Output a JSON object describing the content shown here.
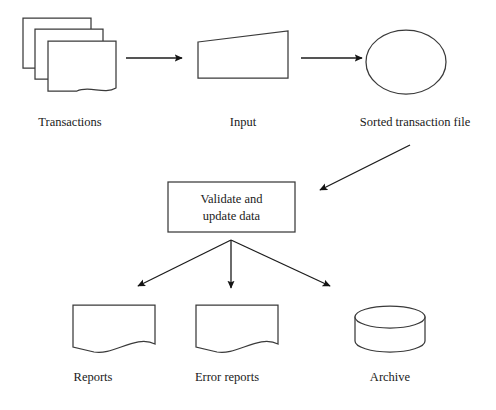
{
  "diagram": {
    "background_color": "#ffffff",
    "stroke_color": "#3a3a3a",
    "arrow_color": "#141414",
    "text_color": "#1a1a1a",
    "nodes": [
      {
        "id": "transactions",
        "label": "Transactions",
        "shape": "document-stack",
        "role": "input-documents"
      },
      {
        "id": "input",
        "label": "Input",
        "shape": "punched-card",
        "role": "input-media"
      },
      {
        "id": "sorted-transaction-file",
        "label": "Sorted transaction file",
        "shape": "circle",
        "role": "magnetic-tape-file"
      },
      {
        "id": "validate-and-update-data",
        "label": "Validate and update data",
        "label_line_1": "Validate and",
        "label_line_2": "update data",
        "shape": "rectangle",
        "role": "process"
      },
      {
        "id": "reports",
        "label": "Reports",
        "shape": "document",
        "role": "output-document"
      },
      {
        "id": "error-reports",
        "label": "Error reports",
        "shape": "document",
        "role": "output-document"
      },
      {
        "id": "archive",
        "label": "Archive",
        "shape": "cylinder",
        "role": "data-store"
      }
    ],
    "edges": [
      {
        "id": "transactions-to-input",
        "from": "transactions",
        "to": "input",
        "direction": "right"
      },
      {
        "id": "input-to-sorted-file",
        "from": "input",
        "to": "sorted-transaction-file",
        "direction": "right"
      },
      {
        "id": "sorted-file-to-validate",
        "from": "sorted-transaction-file",
        "to": "validate-and-update-data",
        "direction": "down-left"
      },
      {
        "id": "validate-to-reports",
        "from": "validate-and-update-data",
        "to": "reports",
        "direction": "down-left"
      },
      {
        "id": "validate-to-error-reports",
        "from": "validate-and-update-data",
        "to": "error-reports",
        "direction": "down"
      },
      {
        "id": "validate-to-archive",
        "from": "validate-and-update-data",
        "to": "archive",
        "direction": "down-right"
      }
    ]
  }
}
